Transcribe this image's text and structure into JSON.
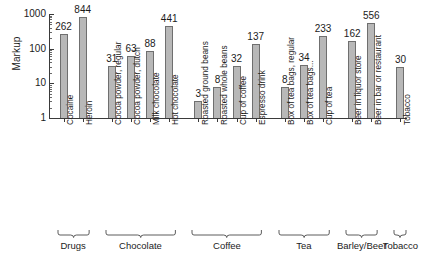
{
  "chart_data": {
    "type": "bar",
    "title": "",
    "subtitle": "",
    "xlabel": "",
    "ylabel": "Markup",
    "yscale": "log",
    "ylim": [
      1,
      1000
    ],
    "grid": false,
    "legend": null,
    "ytick_labels": [
      "1000",
      "100",
      "10",
      "1"
    ],
    "ytick_values": [
      1000,
      100,
      10,
      1
    ],
    "categories": [
      "Cocaine",
      "Heroin",
      "Cocoa powder, regular",
      "Cocoa powder, dutch",
      "Milk chocolate",
      "Hot chocolate",
      "Roasted ground beans",
      "Roasted whole beans",
      "Cup of coffee",
      "Espresso drink",
      "Box of tea bags, regular",
      "Box of tea bags...",
      "Cup of tea",
      "Beer in liquor store",
      "Beer in bar or restaurant",
      "Tobacco"
    ],
    "values": [
      262,
      844,
      31,
      63,
      88,
      441,
      3,
      8,
      32,
      137,
      8,
      34,
      233,
      162,
      556,
      30
    ],
    "data_labels": [
      "262",
      "844",
      "31",
      "63",
      "88",
      "441",
      "3",
      "8",
      "32",
      "137",
      "8",
      "34",
      "233",
      "162",
      "556",
      "30"
    ],
    "groups": [
      {
        "label": "Drugs",
        "indices": [
          0,
          1
        ]
      },
      {
        "label": "Chocolate",
        "indices": [
          2,
          3,
          4,
          5
        ]
      },
      {
        "label": "Coffee",
        "indices": [
          6,
          7,
          8,
          9
        ]
      },
      {
        "label": "Tea",
        "indices": [
          10,
          11,
          12
        ]
      },
      {
        "label": "Barley/Beer",
        "indices": [
          13,
          14
        ]
      },
      {
        "label": "Tobacco",
        "indices": [
          15
        ]
      }
    ],
    "bar_color": "#b8b8b8",
    "bar_edge_color": "#6f6f6f",
    "axis_color": "#3a3a3a"
  }
}
